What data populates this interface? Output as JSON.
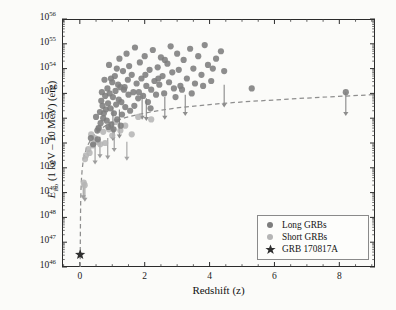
{
  "chart_data": {
    "type": "scatter",
    "title": "",
    "xlabel": "Redshift (z)",
    "ylabel": "E_iso (1 keV - 10 MeV) (erg)",
    "ylabel_parts": {
      "symbol": "E",
      "subscript": "iso",
      "rest": "(1 keV – 10 MeV) (erg)"
    },
    "xlim": [
      -0.55,
      9.1
    ],
    "ylim_log10": [
      46,
      56
    ],
    "xticks": [
      0,
      2,
      4,
      6,
      8
    ],
    "xtick_labels": [
      "0",
      "2",
      "4",
      "6",
      "8"
    ],
    "yticks_log10": [
      46,
      47,
      48,
      49,
      50,
      51,
      52,
      53,
      54,
      55,
      56
    ],
    "ytick_labels": [
      "10^46",
      "10^47",
      "10^48",
      "10^49",
      "10^50",
      "10^51",
      "10^52",
      "10^53",
      "10^54",
      "10^55",
      "10^56"
    ],
    "yscale": "log",
    "grid": false,
    "minor_ticks": true,
    "legend_position": "lower right",
    "legend_entries": [
      {
        "label": "Long GRBs",
        "marker": "circle",
        "color": "#7d7d7d"
      },
      {
        "label": "Short GRBs",
        "marker": "circle",
        "color": "#b5b5b5"
      },
      {
        "label": "GRB 170817A",
        "marker": "star",
        "color": "#3a3a3a"
      }
    ],
    "threshold_curve": {
      "name": "detection threshold",
      "style": "dashed",
      "color": "#8e8e8e",
      "points": [
        [
          0.011,
          46.0
        ],
        [
          0.013,
          46.6
        ],
        [
          0.016,
          47.3
        ],
        [
          0.02,
          48.0
        ],
        [
          0.026,
          48.6
        ],
        [
          0.035,
          49.1
        ],
        [
          0.05,
          49.55
        ],
        [
          0.07,
          49.9
        ],
        [
          0.1,
          50.25
        ],
        [
          0.15,
          50.55
        ],
        [
          0.22,
          50.85
        ],
        [
          0.32,
          51.1
        ],
        [
          0.45,
          51.35
        ],
        [
          0.62,
          51.55
        ],
        [
          0.85,
          51.75
        ],
        [
          1.1,
          51.9
        ],
        [
          1.4,
          52.02
        ],
        [
          1.8,
          52.15
        ],
        [
          2.3,
          52.28
        ],
        [
          2.9,
          52.4
        ],
        [
          3.6,
          52.5
        ],
        [
          4.4,
          52.6
        ],
        [
          5.3,
          52.68
        ],
        [
          6.3,
          52.76
        ],
        [
          7.4,
          52.84
        ],
        [
          8.6,
          52.92
        ],
        [
          9.1,
          52.95
        ]
      ]
    },
    "series": [
      {
        "name": "Long GRBs",
        "marker": "circle",
        "color": "#7d7d7d",
        "points": [
          [
            0.34,
            51.2
          ],
          [
            0.41,
            50.95
          ],
          [
            0.54,
            51.5
          ],
          [
            0.55,
            51.15
          ],
          [
            0.62,
            52.25
          ],
          [
            0.64,
            51.8
          ],
          [
            0.68,
            53.05
          ],
          [
            0.7,
            52.5
          ],
          [
            0.72,
            52.0
          ],
          [
            0.76,
            53.55
          ],
          [
            0.78,
            52.9
          ],
          [
            0.8,
            52.35
          ],
          [
            0.83,
            51.9
          ],
          [
            0.85,
            53.2
          ],
          [
            0.87,
            52.6
          ],
          [
            0.9,
            54.15
          ],
          [
            0.92,
            53.0
          ],
          [
            0.94,
            52.4
          ],
          [
            0.97,
            51.75
          ],
          [
            1.0,
            53.45
          ],
          [
            1.02,
            52.85
          ],
          [
            1.05,
            52.2
          ],
          [
            1.08,
            53.7
          ],
          [
            1.1,
            53.1
          ],
          [
            1.12,
            52.55
          ],
          [
            1.15,
            51.95
          ],
          [
            1.18,
            53.35
          ],
          [
            1.2,
            52.75
          ],
          [
            1.22,
            54.4
          ],
          [
            1.25,
            53.25
          ],
          [
            1.28,
            52.65
          ],
          [
            1.3,
            52.15
          ],
          [
            1.33,
            53.9
          ],
          [
            1.36,
            53.15
          ],
          [
            1.4,
            52.45
          ],
          [
            1.44,
            54.6
          ],
          [
            1.48,
            53.55
          ],
          [
            1.5,
            52.95
          ],
          [
            1.55,
            52.3
          ],
          [
            1.6,
            53.75
          ],
          [
            1.65,
            53.05
          ],
          [
            1.7,
            54.85
          ],
          [
            1.75,
            53.4
          ],
          [
            1.8,
            52.8
          ],
          [
            1.85,
            54.25
          ],
          [
            1.9,
            53.6
          ],
          [
            1.95,
            52.9
          ],
          [
            2.0,
            54.5
          ],
          [
            2.05,
            53.3
          ],
          [
            2.1,
            52.65
          ],
          [
            2.15,
            53.95
          ],
          [
            2.2,
            53.15
          ],
          [
            2.25,
            54.75
          ],
          [
            2.3,
            53.5
          ],
          [
            2.35,
            52.95
          ],
          [
            2.4,
            54.05
          ],
          [
            2.45,
            53.35
          ],
          [
            2.5,
            54.45
          ],
          [
            2.55,
            53.7
          ],
          [
            2.6,
            53.0
          ],
          [
            2.7,
            54.2
          ],
          [
            2.75,
            53.45
          ],
          [
            2.8,
            54.9
          ],
          [
            2.85,
            53.85
          ],
          [
            2.9,
            53.2
          ],
          [
            3.0,
            54.6
          ],
          [
            3.05,
            53.95
          ],
          [
            3.1,
            53.3
          ],
          [
            3.2,
            54.35
          ],
          [
            3.3,
            53.6
          ],
          [
            3.4,
            54.8
          ],
          [
            3.5,
            54.0
          ],
          [
            3.55,
            53.4
          ],
          [
            3.65,
            54.5
          ],
          [
            3.75,
            53.75
          ],
          [
            3.85,
            54.95
          ],
          [
            3.95,
            54.15
          ],
          [
            4.05,
            53.5
          ],
          [
            4.2,
            54.4
          ],
          [
            4.35,
            54.7
          ],
          [
            4.45,
            53.9
          ],
          [
            5.3,
            53.2
          ],
          [
            8.2,
            53.05
          ],
          [
            0.5,
            52.05
          ],
          [
            0.58,
            51.6
          ],
          [
            0.66,
            52.7
          ],
          [
            0.74,
            52.2
          ],
          [
            0.88,
            51.65
          ],
          [
            0.96,
            53.6
          ],
          [
            1.04,
            51.55
          ],
          [
            1.14,
            54.0
          ],
          [
            1.26,
            51.7
          ],
          [
            1.38,
            53.25
          ],
          [
            1.52,
            54.1
          ],
          [
            1.68,
            52.5
          ],
          [
            1.82,
            53.05
          ],
          [
            2.02,
            53.75
          ],
          [
            2.18,
            52.4
          ],
          [
            2.42,
            53.6
          ],
          [
            2.62,
            54.35
          ],
          [
            2.95,
            52.85
          ],
          [
            3.15,
            53.15
          ],
          [
            3.45,
            53.0
          ],
          [
            3.8,
            53.3
          ],
          [
            4.1,
            54.0
          ]
        ]
      },
      {
        "name": "Short GRBs",
        "marker": "circle",
        "color": "#b5b5b5",
        "points": [
          [
            0.12,
            49.4
          ],
          [
            0.15,
            49.3
          ],
          [
            0.16,
            50.35
          ],
          [
            0.19,
            50.5
          ],
          [
            0.26,
            50.75
          ],
          [
            0.3,
            50.6
          ],
          [
            0.35,
            51.35
          ],
          [
            0.4,
            50.9
          ],
          [
            0.46,
            51.2
          ],
          [
            0.55,
            51.05
          ],
          [
            0.58,
            51.6
          ],
          [
            0.72,
            51.45
          ],
          [
            0.78,
            51.0
          ],
          [
            0.9,
            51.55
          ],
          [
            1.0,
            51.3
          ],
          [
            1.1,
            51.85
          ],
          [
            1.25,
            51.5
          ],
          [
            1.4,
            51.7
          ],
          [
            1.6,
            51.35
          ],
          [
            1.8,
            52.05
          ],
          [
            2.2,
            51.95
          ],
          [
            0.63,
            50.95
          ]
        ]
      }
    ],
    "upper_limits": [
      {
        "z": 0.155,
        "log_e": 49.45,
        "dy": 0.75,
        "color": "#9d9d9d"
      },
      {
        "z": 0.47,
        "log_e": 50.95,
        "dy": 0.75,
        "color": "#9d9d9d"
      },
      {
        "z": 0.62,
        "log_e": 51.25,
        "dy": 0.8,
        "color": "#9d9d9d"
      },
      {
        "z": 0.86,
        "log_e": 51.2,
        "dy": 0.8,
        "color": "#9d9d9d"
      },
      {
        "z": 1.02,
        "log_e": 52.45,
        "dy": 1.3,
        "color": "#8d8d8d"
      },
      {
        "z": 1.06,
        "log_e": 51.55,
        "dy": 0.85,
        "color": "#9d9d9d"
      },
      {
        "z": 1.22,
        "log_e": 52.35,
        "dy": 1.1,
        "color": "#8d8d8d"
      },
      {
        "z": 1.45,
        "log_e": 51.05,
        "dy": 0.7,
        "color": "#a5a5a5"
      },
      {
        "z": 1.92,
        "log_e": 52.95,
        "dy": 0.95,
        "color": "#8d8d8d"
      },
      {
        "z": 2.05,
        "log_e": 52.8,
        "dy": 0.85,
        "color": "#8d8d8d"
      },
      {
        "z": 2.62,
        "log_e": 52.85,
        "dy": 0.85,
        "color": "#8d8d8d"
      },
      {
        "z": 3.25,
        "log_e": 52.95,
        "dy": 0.8,
        "color": "#8d8d8d"
      },
      {
        "z": 4.45,
        "log_e": 53.35,
        "dy": 0.85,
        "color": "#8d8d8d"
      },
      {
        "z": 8.2,
        "log_e": 53.05,
        "dy": 0.9,
        "color": "#8d8d8d"
      },
      {
        "z": 0.105,
        "log_e": 49.35,
        "dy": 0.55,
        "color": "#9d9d9d"
      }
    ],
    "highlight_point": {
      "label": "GRB 170817A",
      "z": 0.0098,
      "log_e": 46.5,
      "marker": "star",
      "color": "#2f2f2f"
    }
  },
  "axes": {
    "x_label": "Redshift (z)",
    "y_label_symbol": "E",
    "y_label_sub": "iso",
    "y_label_rest": "(1 keV – 10 MeV) (erg)"
  },
  "legend": {
    "items": [
      {
        "label": "Long GRBs"
      },
      {
        "label": "Short GRBs"
      },
      {
        "label": "GRB 170817A"
      }
    ]
  }
}
